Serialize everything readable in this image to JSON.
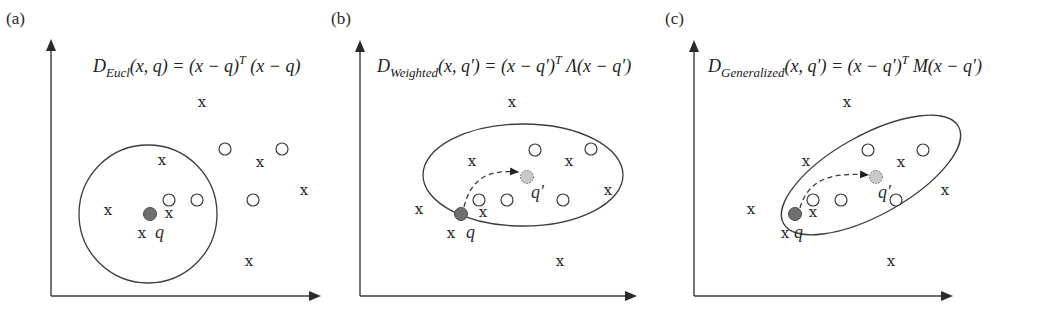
{
  "figure": {
    "panels": [
      {
        "id": "a",
        "label": "(a)",
        "formula": {
          "D": "D",
          "subscript": "Eucl",
          "args": "(x, q)",
          "eq": " = (x − q)",
          "sup": "T",
          "rest": " (x − q)"
        },
        "q_label": "q",
        "region": "circle"
      },
      {
        "id": "b",
        "label": "(b)",
        "formula": {
          "D": "D",
          "subscript": "Weighted",
          "args": "(x, q′)",
          "eq": " = (x − q′)",
          "sup": "T",
          "rest": " Λ(x − q′)"
        },
        "q_label": "q",
        "q_prime_label": "q′",
        "region": "axis-aligned ellipse"
      },
      {
        "id": "c",
        "label": "(c)",
        "formula": {
          "D": "D",
          "subscript": "Generalized",
          "args": "(x, q′)",
          "eq": " = (x − q′)",
          "sup": "T",
          "rest": " M(x − q′)"
        },
        "q_label": "q",
        "q_prime_label": "q′",
        "region": "rotated ellipse"
      }
    ],
    "point_symbols": {
      "class_x": "x",
      "class_o": "circle-hollow",
      "query": "filled-circle",
      "shifted_query": "dashed-light-circle"
    },
    "colors": {
      "ink": "#2a2a2a",
      "query_fill": "#6f6f6f",
      "shifted_query_fill": "#c9c9c9",
      "background": "#ffffff"
    }
  }
}
